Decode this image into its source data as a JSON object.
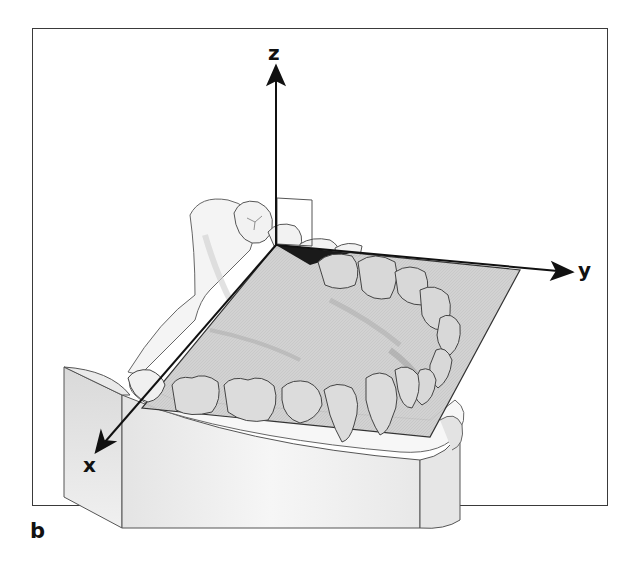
{
  "figure": {
    "panel_label": "b",
    "axes": {
      "x": {
        "label": "x"
      },
      "y": {
        "label": "y"
      },
      "z": {
        "label": "z"
      }
    },
    "colors": {
      "frame": "#3a3a3a",
      "axis": "#111111",
      "plane_fill": "#c9c9c9",
      "plane_edge": "#222222",
      "cast_fill": "#f3f3f3",
      "tooth_fill": "#dedede",
      "outline": "#555555",
      "wedge": "#1a1a1a"
    }
  }
}
